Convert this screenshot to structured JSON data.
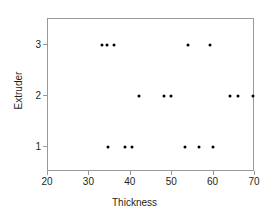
{
  "chart_data": {
    "type": "scatter",
    "title": "",
    "xlabel": "Thickness",
    "ylabel": "Extruder",
    "xlim": [
      20,
      70
    ],
    "ylim": [
      0.5,
      3.5
    ],
    "xticks": [
      20,
      30,
      40,
      50,
      60,
      70
    ],
    "yticks": [
      1,
      2,
      3
    ],
    "grid": false,
    "legend": null,
    "marker": "filled-circle",
    "marker_color": "#000000",
    "points": [
      {
        "x": 33.0,
        "y": 3
      },
      {
        "x": 34.2,
        "y": 3
      },
      {
        "x": 36.0,
        "y": 3
      },
      {
        "x": 53.9,
        "y": 3
      },
      {
        "x": 59.2,
        "y": 3
      },
      {
        "x": 42.0,
        "y": 2
      },
      {
        "x": 48.0,
        "y": 2
      },
      {
        "x": 49.7,
        "y": 2
      },
      {
        "x": 64.0,
        "y": 2
      },
      {
        "x": 65.9,
        "y": 2
      },
      {
        "x": 69.4,
        "y": 2
      },
      {
        "x": 34.5,
        "y": 1
      },
      {
        "x": 38.6,
        "y": 1
      },
      {
        "x": 40.3,
        "y": 1
      },
      {
        "x": 53.1,
        "y": 1
      },
      {
        "x": 56.5,
        "y": 1
      },
      {
        "x": 59.9,
        "y": 1
      }
    ]
  },
  "axes": {
    "x_title": "Thickness",
    "y_title": "Extruder",
    "x_tick_labels": [
      "20",
      "30",
      "40",
      "50",
      "60",
      "70"
    ],
    "y_tick_labels": [
      "1",
      "2",
      "3"
    ]
  },
  "colors": {
    "marker": "#000000",
    "frame": "#9a9a9a",
    "text": "#231f20",
    "background": "#ffffff"
  }
}
